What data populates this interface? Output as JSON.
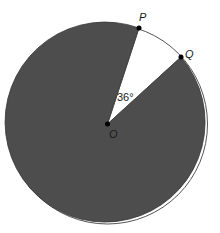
{
  "diagram": {
    "type": "circle-sector",
    "center_label": "O",
    "point_labels": [
      "P",
      "Q"
    ],
    "angle_label": "36°",
    "colors": {
      "shaded": "#4d4d4d",
      "unshaded": "#ffffff",
      "outline": "#333333",
      "points": "#000000"
    }
  }
}
